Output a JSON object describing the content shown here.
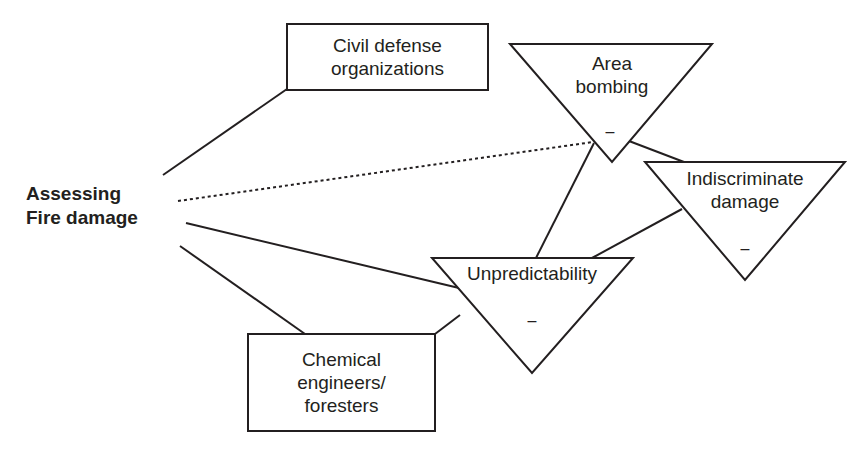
{
  "diagram": {
    "central_node": {
      "line1": "Assessing",
      "line2": "Fire damage"
    },
    "actors": [
      {
        "id": "civil",
        "line1": "Civil defense",
        "line2": "organizations"
      },
      {
        "id": "chemical",
        "line1": "Chemical",
        "line2": "engineers/",
        "line3": "foresters"
      }
    ],
    "issues": [
      {
        "id": "area",
        "line1": "Area",
        "line2": "bombing",
        "valence": "–"
      },
      {
        "id": "indiscriminate",
        "line1": "Indiscriminate",
        "line2": "damage",
        "valence": "–"
      },
      {
        "id": "unpredictability",
        "line1": "Unpredictability",
        "valence": "–"
      }
    ],
    "links": [
      {
        "from": "Assessing Fire damage",
        "to": "Civil defense organizations",
        "style": "solid"
      },
      {
        "from": "Assessing Fire damage",
        "to": "Area bombing",
        "style": "dotted"
      },
      {
        "from": "Assessing Fire damage",
        "to": "Unpredictability",
        "style": "solid"
      },
      {
        "from": "Assessing Fire damage",
        "to": "Chemical engineers/foresters",
        "style": "solid"
      },
      {
        "from": "Chemical engineers/foresters",
        "to": "Unpredictability",
        "style": "solid"
      },
      {
        "from": "Area bombing",
        "to": "Unpredictability",
        "style": "solid"
      },
      {
        "from": "Area bombing",
        "to": "Indiscriminate damage",
        "style": "solid"
      },
      {
        "from": "Indiscriminate damage",
        "to": "Unpredictability",
        "style": "solid"
      }
    ],
    "colors": {
      "stroke": "#231f20",
      "background": "#ffffff"
    }
  }
}
